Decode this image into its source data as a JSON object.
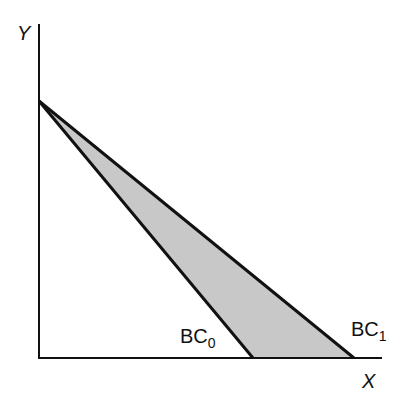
{
  "diagram": {
    "type": "budget_constraint",
    "axes": {
      "y_label": "Y",
      "x_label": "X"
    },
    "lines": [
      {
        "name": "BC0",
        "label_main": "BC",
        "label_sub": "0"
      },
      {
        "name": "BC1",
        "label_main": "BC",
        "label_sub": "1"
      }
    ],
    "shaded_region": "area between BC0 and BC1",
    "colors": {
      "axis": "#111111",
      "line": "#111111",
      "fill": "#c8c8c8",
      "background": "#ffffff"
    }
  }
}
